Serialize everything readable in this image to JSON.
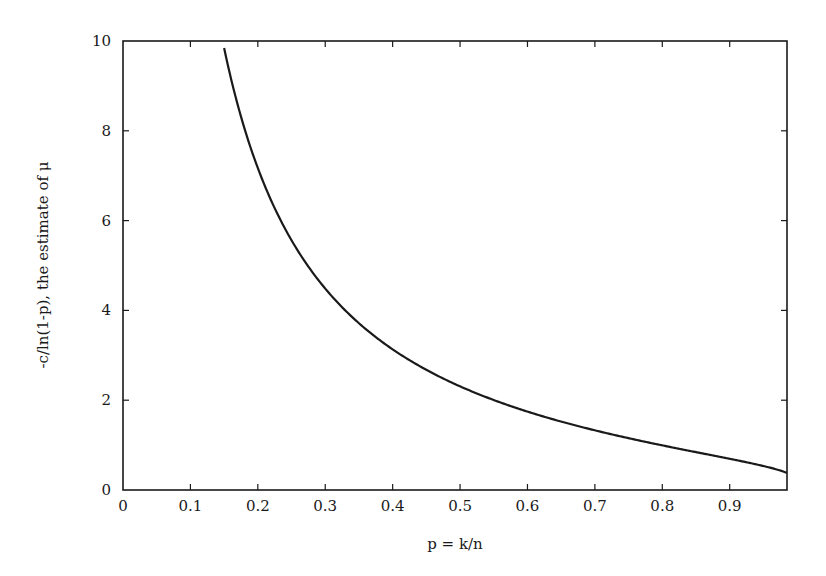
{
  "chart_data": {
    "type": "line",
    "title": "",
    "xlabel": "p = k/n",
    "ylabel": "-c/ln(1-p), the estimate of μ",
    "xlim": [
      0,
      0.985
    ],
    "ylim": [
      0,
      10
    ],
    "grid": false,
    "legend": null,
    "x_ticks": [
      "0",
      "0.1",
      "0.2",
      "0.3",
      "0.4",
      "0.5",
      "0.6",
      "0.7",
      "0.8",
      "0.9"
    ],
    "y_ticks": [
      "0",
      "2",
      "4",
      "6",
      "8",
      "10"
    ],
    "series": [
      {
        "name": "-c/ln(1-p)",
        "color": "#1a1a1a",
        "function": "-c/ln(1-p)",
        "c": 1.6,
        "x": [
          0.15,
          0.2,
          0.25,
          0.3,
          0.35,
          0.4,
          0.45,
          0.5,
          0.55,
          0.6,
          0.65,
          0.7,
          0.75,
          0.8,
          0.85,
          0.9,
          0.95,
          0.985
        ],
        "y": [
          9.85,
          7.17,
          5.56,
          4.49,
          3.71,
          3.13,
          2.68,
          2.31,
          2.0,
          1.75,
          1.52,
          1.33,
          1.15,
          0.99,
          0.84,
          0.69,
          0.53,
          0.38
        ]
      }
    ]
  }
}
